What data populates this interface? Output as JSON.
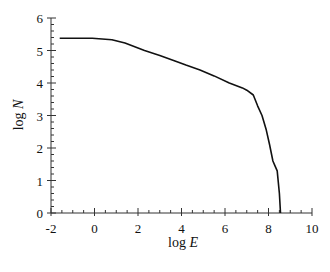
{
  "chart_data": {
    "type": "line",
    "title": "",
    "xlabel": "log E",
    "ylabel": "log N",
    "xlim": [
      -2,
      10
    ],
    "ylim": [
      0,
      6
    ],
    "xticks": [
      -2,
      0,
      2,
      4,
      6,
      8,
      10
    ],
    "yticks": [
      0,
      1,
      2,
      3,
      4,
      5,
      6
    ],
    "grid": false,
    "legend": null,
    "series": [
      {
        "name": "log N vs log E",
        "x": [
          -1.6,
          -0.1,
          0.8,
          1.4,
          2.3,
          3.0,
          3.7,
          4.2,
          4.85,
          5.5,
          6.2,
          6.8,
          7.0,
          7.3,
          7.5,
          7.7,
          7.9,
          8.05,
          8.2,
          8.3,
          8.4,
          8.5,
          8.55
        ],
        "y": [
          5.38,
          5.38,
          5.33,
          5.23,
          5.0,
          4.85,
          4.68,
          4.55,
          4.4,
          4.22,
          4.0,
          3.85,
          3.78,
          3.63,
          3.3,
          3.0,
          2.55,
          2.1,
          1.6,
          1.45,
          1.3,
          0.6,
          0.0
        ]
      }
    ]
  },
  "labels": {
    "x_axis": "log E",
    "y_axis": "log N"
  }
}
